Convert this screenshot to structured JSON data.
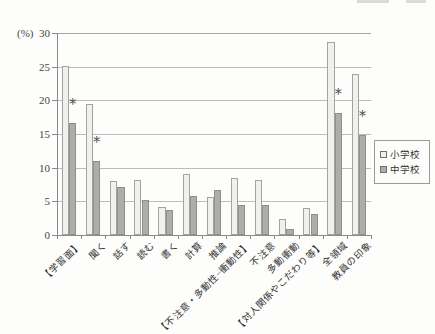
{
  "chart_data": {
    "type": "bar",
    "title": "",
    "unit_label": "(%)",
    "ylim": [
      0,
      30
    ],
    "yticks": [
      30,
      25,
      20,
      15,
      10,
      5,
      0
    ],
    "grid": true,
    "legend_position": "right",
    "categories": [
      "【学習面】",
      "聞く",
      "話す",
      "読む",
      "書く",
      "計算",
      "推論",
      "【不注意・多動性−衝動性】",
      "不注意",
      "多動衝動",
      "【対人関係やこだわり等】",
      "全領域",
      "教員の印象"
    ],
    "series": [
      {
        "name": "小学校",
        "style": "light",
        "fill": "#f1f0ee",
        "border": "#a3a3a1",
        "values": [
          25.1,
          19.5,
          8.0,
          8.2,
          4.1,
          9.1,
          5.6,
          8.5,
          8.2,
          2.4,
          4.0,
          28.7,
          23.9
        ]
      },
      {
        "name": "中学校",
        "style": "dark",
        "fill": "#adadab",
        "border": "#8f8f8d",
        "values": [
          16.7,
          11.0,
          7.2,
          5.2,
          3.7,
          5.8,
          6.7,
          4.5,
          4.4,
          0.9,
          3.1,
          18.2,
          14.8
        ]
      }
    ],
    "significance": {
      "symbol": "*",
      "marked_series": "中学校",
      "marked_category_indices": [
        0,
        1,
        11,
        12
      ],
      "marked_categories": [
        "【学習面】",
        "聞く",
        "全領域",
        "教員の印象"
      ]
    },
    "colors": {
      "axis": "#8a8a88",
      "gridline": "#bcbcba",
      "text": "#3a3a38",
      "background": "#fdfdfb"
    }
  }
}
